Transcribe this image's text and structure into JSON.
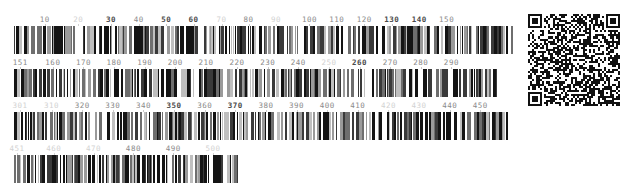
{
  "canvas": {
    "width": 619,
    "height": 192,
    "background": "#ffffff"
  },
  "colors": {
    "bar_dark": "#141414",
    "bar_mid": "#6e6e6e",
    "bar_light": "#bfbfbf",
    "tick_label": "#8a8a8a",
    "tick_label_strong": "#4a4a4a",
    "tick_label_faint": "#d2d2d2",
    "background": "#ffffff"
  },
  "rows": [
    {
      "name": "barcode-row-1",
      "x": 14,
      "y": 14,
      "width": 499,
      "bar_height": 28,
      "range_start": 1,
      "range_end": 150,
      "ticks": [
        {
          "value": "10",
          "pos": 0.0617,
          "strength": "normal"
        },
        {
          "value": "20",
          "pos": 0.1288,
          "strength": "faint"
        },
        {
          "value": "30",
          "pos": 0.1944,
          "strength": "strong"
        },
        {
          "value": "40",
          "pos": 0.2498,
          "strength": "normal"
        },
        {
          "value": "50",
          "pos": 0.305,
          "strength": "strong"
        },
        {
          "value": "60",
          "pos": 0.36,
          "strength": "strong"
        },
        {
          "value": "70",
          "pos": 0.416,
          "strength": "faint"
        },
        {
          "value": "80",
          "pos": 0.47,
          "strength": "normal"
        },
        {
          "value": "90",
          "pos": 0.525,
          "strength": "faint"
        },
        {
          "value": "100",
          "pos": 0.592,
          "strength": "normal"
        },
        {
          "value": "110",
          "pos": 0.647,
          "strength": "normal"
        },
        {
          "value": "120",
          "pos": 0.702,
          "strength": "normal"
        },
        {
          "value": "130",
          "pos": 0.757,
          "strength": "strong"
        },
        {
          "value": "140",
          "pos": 0.812,
          "strength": "strong"
        },
        {
          "value": "150",
          "pos": 0.867,
          "strength": "normal"
        }
      ],
      "bar_seed": 1741
    },
    {
      "name": "barcode-row-2",
      "x": 14,
      "y": 57,
      "width": 486,
      "bar_height": 28,
      "range_start": 151,
      "range_end": 300,
      "ticks": [
        {
          "value": "151",
          "pos": 0.013,
          "strength": "normal"
        },
        {
          "value": "160",
          "pos": 0.08,
          "strength": "normal"
        },
        {
          "value": "170",
          "pos": 0.143,
          "strength": "normal"
        },
        {
          "value": "180",
          "pos": 0.206,
          "strength": "normal"
        },
        {
          "value": "190",
          "pos": 0.269,
          "strength": "normal"
        },
        {
          "value": "200",
          "pos": 0.332,
          "strength": "normal"
        },
        {
          "value": "210",
          "pos": 0.395,
          "strength": "normal"
        },
        {
          "value": "220",
          "pos": 0.459,
          "strength": "normal"
        },
        {
          "value": "230",
          "pos": 0.522,
          "strength": "normal"
        },
        {
          "value": "240",
          "pos": 0.585,
          "strength": "normal"
        },
        {
          "value": "250",
          "pos": 0.648,
          "strength": "faint"
        },
        {
          "value": "260",
          "pos": 0.711,
          "strength": "strong"
        },
        {
          "value": "270",
          "pos": 0.774,
          "strength": "normal"
        },
        {
          "value": "280",
          "pos": 0.837,
          "strength": "normal"
        },
        {
          "value": "290",
          "pos": 0.9,
          "strength": "normal"
        }
      ],
      "bar_seed": 9032
    },
    {
      "name": "barcode-row-3",
      "x": 14,
      "y": 100,
      "width": 494,
      "bar_height": 28,
      "range_start": 301,
      "range_end": 450,
      "ticks": [
        {
          "value": "301",
          "pos": 0.012,
          "strength": "faint"
        },
        {
          "value": "310",
          "pos": 0.076,
          "strength": "faint"
        },
        {
          "value": "320",
          "pos": 0.138,
          "strength": "normal"
        },
        {
          "value": "330",
          "pos": 0.2,
          "strength": "normal"
        },
        {
          "value": "340",
          "pos": 0.262,
          "strength": "normal"
        },
        {
          "value": "350",
          "pos": 0.324,
          "strength": "strong"
        },
        {
          "value": "360",
          "pos": 0.386,
          "strength": "normal"
        },
        {
          "value": "370",
          "pos": 0.448,
          "strength": "strong"
        },
        {
          "value": "380",
          "pos": 0.51,
          "strength": "normal"
        },
        {
          "value": "390",
          "pos": 0.572,
          "strength": "normal"
        },
        {
          "value": "400",
          "pos": 0.634,
          "strength": "normal"
        },
        {
          "value": "410",
          "pos": 0.696,
          "strength": "normal"
        },
        {
          "value": "420",
          "pos": 0.758,
          "strength": "faint"
        },
        {
          "value": "430",
          "pos": 0.82,
          "strength": "faint"
        },
        {
          "value": "440",
          "pos": 0.882,
          "strength": "normal"
        },
        {
          "value": "450",
          "pos": 0.944,
          "strength": "normal"
        }
      ],
      "bar_seed": 5517
    },
    {
      "name": "barcode-row-4",
      "x": 14,
      "y": 143,
      "width": 224,
      "bar_height": 28,
      "range_start": 451,
      "range_end": 500,
      "ticks": [
        {
          "value": "451",
          "pos": 0.013,
          "strength": "faint"
        },
        {
          "value": "460",
          "pos": 0.178,
          "strength": "faint"
        },
        {
          "value": "470",
          "pos": 0.355,
          "strength": "faint"
        },
        {
          "value": "480",
          "pos": 0.533,
          "strength": "normal"
        },
        {
          "value": "490",
          "pos": 0.711,
          "strength": "normal"
        },
        {
          "value": "500",
          "pos": 0.888,
          "strength": "faint"
        }
      ],
      "bar_seed": 3308
    }
  ],
  "qr": {
    "name": "qr-code",
    "x": 528,
    "y": 14,
    "size": 92,
    "modules": 45,
    "quiet_zone": 1,
    "seed": 20461,
    "foreground": "#111111",
    "background": "#ffffff"
  }
}
